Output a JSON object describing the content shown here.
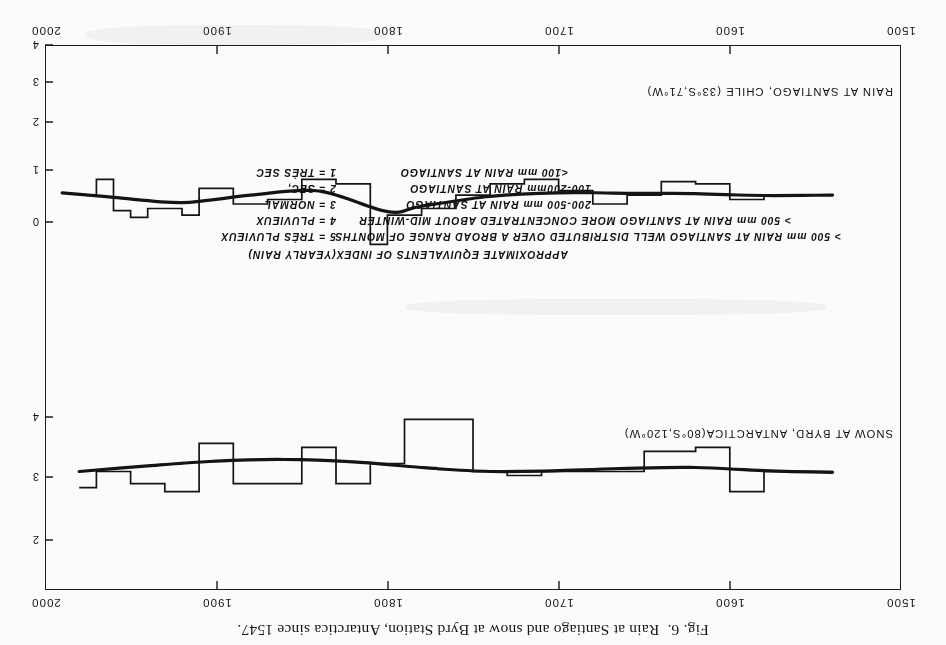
{
  "figure": {
    "caption": "Fig. 6.  Rain at Santiago and snow at Byrd Station, Antarctica since 1547.",
    "x_axis": {
      "label": "",
      "ticks": [
        "1500",
        "1600",
        "1700",
        "1800",
        "1900",
        "2000"
      ],
      "values": [
        1500,
        1600,
        1700,
        1800,
        1900,
        2000
      ],
      "min": 1500,
      "max": 2000
    },
    "panels": [
      {
        "id": "byrd-snow",
        "series_title": "SNOW AT BYRD, ANTARCTICA(80°S,120°W)",
        "axis_title": "DECADE VALUES OF AVERAGE YEARLY\nACCUMULATION IN GRAMS/CM²",
        "y_ticks": [
          "2",
          "3",
          "4"
        ],
        "y_values": [
          2,
          3,
          4
        ]
      },
      {
        "id": "santiago-rain",
        "series_title": "RAIN AT SANTIAGO, CHILE (33°S,71°W)",
        "axis_title": "DECADE VALUES OF THE ANNUAL 1-5\nINDEX AT SANTIAGO",
        "y_ticks": [
          "0",
          "1",
          "2",
          "3",
          "4"
        ],
        "y_values": [
          0,
          1,
          2,
          3,
          4
        ]
      }
    ],
    "legend": {
      "heading": "APPROXIMATE  EQUIVALENTS  OF  INDEX(YEARLY RAIN)",
      "rows": [
        {
          "index": "5 = TRÈS PLUVIEUX",
          "equivalent": "> 500 mm  RAIN AT SANTIAGO WELL DISTRIBUTED OVER A BROAD RANGE OF MONTHS"
        },
        {
          "index": "4 = PLUVIEUX",
          "equivalent": "> 500 mm  RAIN AT SANTIAGO MORE CONCENTRATED ABOUT MID-WINTER"
        },
        {
          "index": "3 = NORMAL",
          "equivalent": "200-500 mm  RAIN AT SANTIAGO"
        },
        {
          "index": "2 = SEC,",
          "equivalent": "100-200mm  RAIN AT SANTIAGO"
        },
        {
          "index": "1 = TRÈS SEC",
          "equivalent": "<100 mm   RAIN AT SANTIAGO"
        }
      ]
    }
  },
  "chart_data": [
    {
      "type": "line",
      "id": "byrd-snow",
      "title": "SNOW AT BYRD, ANTARCTICA(80°S,120°W)",
      "xlabel": "",
      "ylabel": "DECADE VALUES OF AVERAGE YEARLY ACCUMULATION IN GRAMS/CM²",
      "xlim": [
        1500,
        2000
      ],
      "ylim": [
        1.6,
        4.4
      ],
      "yticks": [
        2,
        3,
        4
      ],
      "xticks": [
        1500,
        1600,
        1700,
        1800,
        1900,
        2000
      ],
      "grid": false,
      "legend": "none",
      "series": [
        {
          "name": "decade accumulation (step)",
          "style": "step",
          "x": [
            1540,
            1550,
            1560,
            1570,
            1580,
            1590,
            1600,
            1610,
            1620,
            1630,
            1640,
            1650,
            1660,
            1670,
            1680,
            1690,
            1700,
            1710,
            1720,
            1730,
            1740,
            1750,
            1760,
            1770,
            1780,
            1790,
            1800,
            1810,
            1820,
            1830,
            1840,
            1850,
            1860,
            1870,
            1880,
            1890,
            1900,
            1910,
            1920,
            1930,
            1940,
            1950,
            1960,
            1970
          ],
          "values": [
            3.05,
            3.05,
            3.05,
            3.05,
            3.3,
            3.3,
            2.75,
            2.75,
            2.8,
            2.8,
            2.8,
            3.05,
            3.05,
            3.05,
            3.05,
            3.05,
            3.05,
            3.1,
            3.1,
            3.05,
            3.05,
            2.4,
            2.4,
            2.4,
            2.4,
            2.95,
            2.95,
            3.2,
            3.2,
            2.75,
            2.75,
            3.2,
            3.2,
            3.2,
            3.2,
            2.7,
            2.7,
            3.3,
            3.3,
            3.2,
            3.2,
            3.05,
            3.05,
            3.25
          ]
        },
        {
          "name": "smoothed trend",
          "style": "smooth",
          "x": [
            1540,
            1580,
            1620,
            1660,
            1700,
            1740,
            1780,
            1820,
            1860,
            1900,
            1940,
            1980
          ],
          "values": [
            3.06,
            3.04,
            3.0,
            3.01,
            3.04,
            3.05,
            3.0,
            2.93,
            2.9,
            2.92,
            2.98,
            3.05
          ]
        }
      ]
    },
    {
      "type": "line",
      "id": "santiago-rain",
      "title": "RAIN AT SANTIAGO, CHILE (33°S,71°W)",
      "xlabel": "",
      "ylabel": "DECADE VALUES OF THE ANNUAL 1-5 INDEX AT SANTIAGO",
      "xlim": [
        1500,
        2000
      ],
      "ylim": [
        -0.4,
        4.4
      ],
      "yticks": [
        0,
        1,
        2,
        3,
        4
      ],
      "xticks": [
        1500,
        1600,
        1700,
        1800,
        1900,
        2000
      ],
      "grid": false,
      "legend": "none",
      "series": [
        {
          "name": "decade index (step)",
          "style": "step",
          "x": [
            1540,
            1550,
            1560,
            1570,
            1580,
            1590,
            1600,
            1610,
            1620,
            1630,
            1640,
            1650,
            1660,
            1670,
            1680,
            1690,
            1700,
            1710,
            1720,
            1730,
            1740,
            1750,
            1760,
            1770,
            1780,
            1790,
            1800,
            1810,
            1820,
            1830,
            1840,
            1850,
            1860,
            1870,
            1880,
            1890,
            1900,
            1910,
            1920,
            1930,
            1940,
            1950,
            1960,
            1970
          ],
          "values": [
            2.95,
            2.95,
            2.95,
            2.95,
            3.05,
            3.05,
            2.7,
            2.7,
            2.65,
            2.65,
            2.95,
            2.95,
            3.15,
            3.15,
            2.85,
            2.85,
            2.6,
            2.6,
            2.7,
            2.7,
            2.95,
            2.95,
            3.25,
            3.25,
            3.4,
            3.4,
            4.05,
            2.7,
            2.7,
            2.6,
            2.6,
            3.05,
            3.05,
            3.15,
            3.15,
            2.8,
            2.8,
            3.4,
            3.25,
            3.25,
            3.45,
            3.3,
            2.6,
            2.95
          ]
        },
        {
          "name": "smoothed trend",
          "style": "smooth",
          "x": [
            1540,
            1580,
            1620,
            1660,
            1700,
            1740,
            1780,
            1800,
            1840,
            1880,
            1920,
            1960,
            1990
          ],
          "values": [
            2.95,
            2.96,
            2.92,
            2.91,
            2.9,
            2.98,
            3.2,
            3.32,
            2.86,
            2.95,
            3.12,
            3.0,
            2.9
          ]
        }
      ]
    }
  ]
}
